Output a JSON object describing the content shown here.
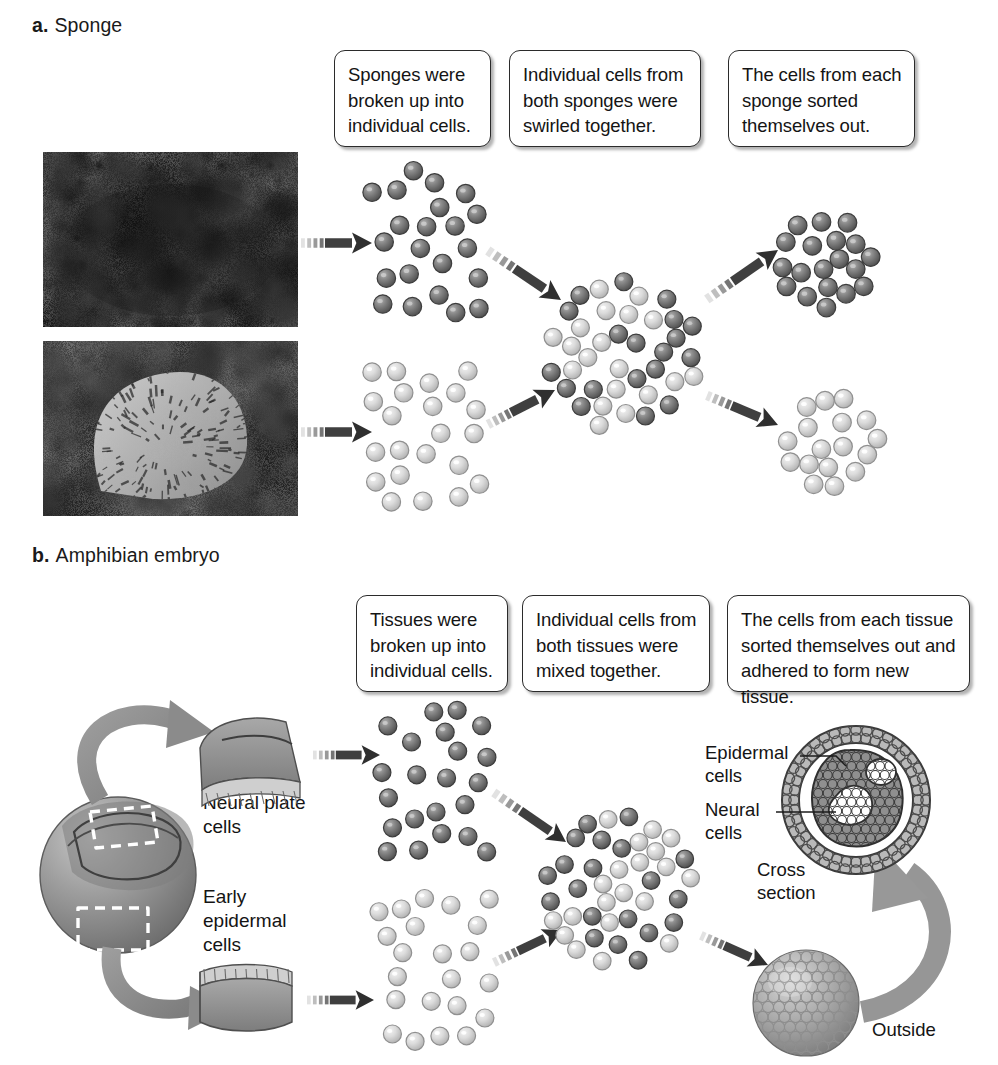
{
  "figure": {
    "title_a": "Sponge",
    "letter_a": "a.",
    "title_b": "Amphibian embryo",
    "letter_b": "b."
  },
  "panel_a": {
    "captions": [
      "Sponges were broken up into individual cells.",
      "Individual cells from both sponges were swirled together.",
      "The cells from each sponge sorted themselves out."
    ],
    "photos": [
      {
        "name": "dark-sponge-photo",
        "tone": "dark"
      },
      {
        "name": "light-sponge-photo",
        "tone": "light"
      }
    ],
    "cell_groups": [
      {
        "name": "dark-sponge-cells-dispersed",
        "type": "dark",
        "count": 22
      },
      {
        "name": "light-sponge-cells-dispersed",
        "type": "light",
        "count": 22
      },
      {
        "name": "mixed-sponge-cells",
        "type": "mixed",
        "count": 46
      },
      {
        "name": "sorted-dark-sponge-cells",
        "type": "dark",
        "count": 22
      },
      {
        "name": "sorted-light-sponge-cells",
        "type": "light",
        "count": 22
      }
    ]
  },
  "panel_b": {
    "captions": [
      "Tissues were broken up into individual cells.",
      "Individual cells from both tissues were mixed together.",
      "The cells from each tissue sorted themselves out and adhered to form new tissue."
    ],
    "tissue_labels": [
      "Neural plate\ncells",
      "Early\nepidermal\ncells"
    ],
    "result_labels": [
      "Epidermal\ncells",
      "Neural\ncells",
      "Cross\nsection",
      "Outside"
    ],
    "cell_groups": [
      {
        "name": "neural-plate-cells-dispersed",
        "type": "dark",
        "count": 22
      },
      {
        "name": "epidermal-cells-dispersed",
        "type": "light",
        "count": 22
      },
      {
        "name": "mixed-embryo-cells",
        "type": "mixed",
        "count": 46
      }
    ]
  },
  "colors": {
    "cell_dark": "#6b6b6b",
    "cell_light": "#c9c9c9",
    "arrow_dark": "#3a3a3a",
    "arrow_gray": "#8c8c8c",
    "outline": "#2b2b2b",
    "text": "#141414"
  }
}
